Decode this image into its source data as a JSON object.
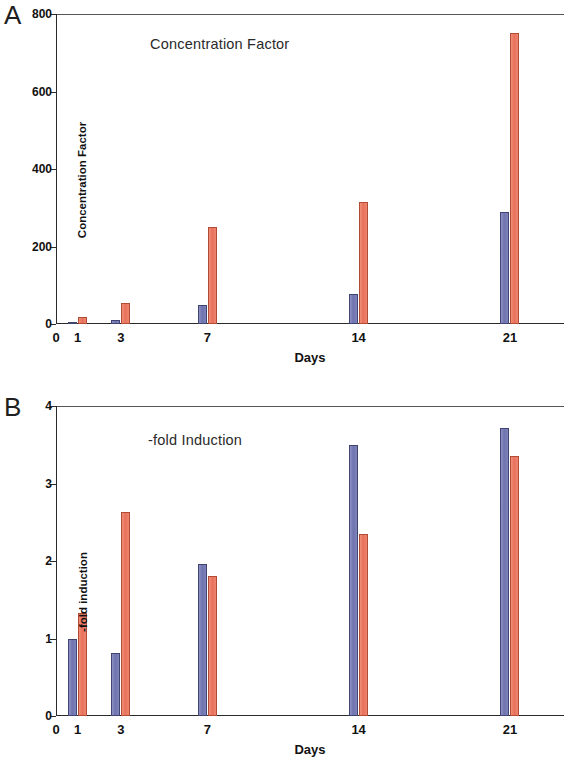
{
  "figure": {
    "panel_a_letter": "A",
    "panel_b_letter": "B"
  },
  "panel_a": {
    "letter": "A",
    "title": "Concentration Factor",
    "xaxis_title": "Days",
    "yaxis_title": "Concentration Factor",
    "yticks": [
      "0",
      "200",
      "400",
      "600",
      "800"
    ],
    "xticks": [
      "0",
      "1",
      "3",
      "7",
      "14",
      "21"
    ]
  },
  "panel_b": {
    "letter": "B",
    "title": "-fold Induction",
    "xaxis_title": "Days",
    "yaxis_title": "-fold induction",
    "yticks": [
      "0",
      "1",
      "2",
      "3",
      "4"
    ],
    "xticks": [
      "0",
      "1",
      "3",
      "7",
      "14",
      "21"
    ]
  },
  "colors": {
    "series_blue": "#7276b4",
    "series_red": "#e8715a",
    "axis": "#2b2b2b",
    "text": "#111111",
    "background": "#ffffff"
  },
  "chart_data": [
    {
      "type": "bar",
      "title": "Concentration Factor",
      "panel": "A",
      "xlabel": "Days",
      "ylabel": "Concentration Factor",
      "categories": [
        "1",
        "3",
        "7",
        "14",
        "21"
      ],
      "x": [
        1,
        3,
        7,
        14,
        21
      ],
      "xlim": [
        0,
        23.5
      ],
      "ylim": [
        0,
        800
      ],
      "yticks": [
        0,
        200,
        400,
        600,
        800
      ],
      "xticks": [
        0,
        1,
        3,
        7,
        14,
        21
      ],
      "grid": false,
      "legend": "none",
      "series": [
        {
          "name": "blue",
          "color": "#7276b4",
          "values": [
            5,
            10,
            50,
            78,
            290
          ]
        },
        {
          "name": "red",
          "color": "#e8715a",
          "values": [
            18,
            55,
            250,
            315,
            750
          ]
        }
      ]
    },
    {
      "type": "bar",
      "title": "-fold Induction",
      "panel": "B",
      "xlabel": "Days",
      "ylabel": "-fold induction",
      "categories": [
        "1",
        "3",
        "7",
        "14",
        "21"
      ],
      "x": [
        1,
        3,
        7,
        14,
        21
      ],
      "xlim": [
        0,
        23.5
      ],
      "ylim": [
        0,
        4
      ],
      "yticks": [
        0,
        1,
        2,
        3,
        4
      ],
      "xticks": [
        0,
        1,
        3,
        7,
        14,
        21
      ],
      "grid": false,
      "legend": "none",
      "series": [
        {
          "name": "blue",
          "color": "#7276b4",
          "values": [
            1.0,
            0.81,
            1.96,
            3.5,
            3.72
          ]
        },
        {
          "name": "red",
          "color": "#e8715a",
          "values": [
            1.33,
            2.63,
            1.81,
            2.35,
            3.35
          ]
        }
      ]
    }
  ]
}
